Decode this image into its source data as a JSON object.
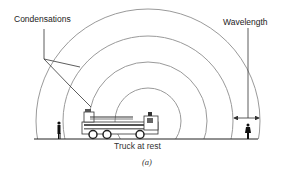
{
  "labels": {
    "condensations": "Condensations",
    "wavelength": "Wavelength",
    "truck": "Truck at rest",
    "figure_tag": "(a)"
  },
  "colors": {
    "wavefront": "#9a9a9a",
    "ink": "#222222",
    "background": "#ffffff"
  },
  "wavefronts": {
    "count": 4,
    "center": [
      148,
      121
    ],
    "radii": [
      33,
      59,
      85,
      112
    ]
  }
}
